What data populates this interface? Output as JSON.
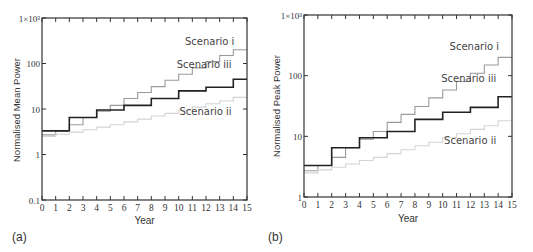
{
  "panels": [
    {
      "id": "a",
      "label": "(a)"
    },
    {
      "id": "b",
      "label": "(b)"
    }
  ],
  "chart_data": [
    {
      "type": "line",
      "step": true,
      "panel": "(a)",
      "title": "",
      "xlabel": "Year",
      "ylabel": "Normalised Mean Power",
      "yscale": "log",
      "xlim": [
        0,
        15
      ],
      "ylim": [
        0.1,
        1000
      ],
      "x_ticks": [
        0,
        1,
        2,
        3,
        4,
        5,
        6,
        7,
        8,
        9,
        10,
        11,
        12,
        13,
        14,
        15
      ],
      "y_ticks": [
        {
          "value": 0.1,
          "label": "0.1"
        },
        {
          "value": 1,
          "label": "1"
        },
        {
          "value": 10,
          "label": "10"
        },
        {
          "value": 100,
          "label": "100"
        },
        {
          "value": 1000,
          "label": "1×10³"
        }
      ],
      "grid": false,
      "x": [
        0,
        1,
        2,
        3,
        4,
        5,
        6,
        7,
        8,
        9,
        10,
        11,
        12,
        13,
        14,
        15
      ],
      "series": [
        {
          "name": "Scenario i",
          "color": "#9a9a9a",
          "width": 1.1,
          "values": [
            2.7,
            3.3,
            4.5,
            6.5,
            9,
            12,
            17,
            23,
            31,
            43,
            58,
            80,
            110,
            150,
            200,
            200
          ]
        },
        {
          "name": "Scenario iii",
          "color": "#222222",
          "width": 1.6,
          "values": [
            3.3,
            3.3,
            6.5,
            6.5,
            9.5,
            9.5,
            12,
            12,
            17,
            17,
            25,
            25,
            30,
            30,
            45,
            45
          ]
        },
        {
          "name": "Scenario ii",
          "color": "#d4d4d4",
          "width": 1.1,
          "values": [
            2.5,
            2.8,
            3.1,
            3.5,
            4,
            4.5,
            5.2,
            6,
            7,
            8,
            9.5,
            11,
            13,
            15,
            18,
            18
          ]
        }
      ],
      "annotations": [
        {
          "text": "Scenario i",
          "x": 13.2,
          "y": 260
        },
        {
          "text": "Scenario iii",
          "x": 13.0,
          "y": 80
        },
        {
          "text": "Scenario ii",
          "x": 13.0,
          "y": 7.5
        }
      ]
    },
    {
      "type": "line",
      "step": true,
      "panel": "(b)",
      "title": "",
      "xlabel": "Year",
      "ylabel": "Normalised Peak Power",
      "yscale": "log",
      "xlim": [
        0,
        15
      ],
      "ylim": [
        1,
        1000
      ],
      "x_ticks": [
        0,
        1,
        2,
        3,
        4,
        5,
        6,
        7,
        8,
        9,
        10,
        11,
        12,
        13,
        14,
        15
      ],
      "y_ticks": [
        {
          "value": 1,
          "label": "1"
        },
        {
          "value": 10,
          "label": "10"
        },
        {
          "value": 100,
          "label": "100"
        },
        {
          "value": 1000,
          "label": "1×10³"
        }
      ],
      "grid": false,
      "x": [
        0,
        1,
        2,
        3,
        4,
        5,
        6,
        7,
        8,
        9,
        10,
        11,
        12,
        13,
        14,
        15
      ],
      "series": [
        {
          "name": "Scenario i",
          "color": "#9a9a9a",
          "width": 1.1,
          "values": [
            2.7,
            3.3,
            4.5,
            6.5,
            9,
            12,
            17,
            23,
            31,
            43,
            58,
            80,
            110,
            150,
            200,
            200
          ]
        },
        {
          "name": "Scenario iii",
          "color": "#222222",
          "width": 1.6,
          "values": [
            3.3,
            3.3,
            6.5,
            6.5,
            9.5,
            9.5,
            12,
            12,
            19,
            19,
            25,
            25,
            30,
            30,
            45,
            45
          ]
        },
        {
          "name": "Scenario ii",
          "color": "#d4d4d4",
          "width": 1.1,
          "values": [
            2.5,
            2.8,
            3.1,
            3.5,
            4,
            4.5,
            5.2,
            6,
            7,
            8,
            9.5,
            11,
            13,
            15,
            18,
            18
          ]
        }
      ],
      "annotations": [
        {
          "text": "Scenario i",
          "x": 13.2,
          "y": 260
        },
        {
          "text": "Scenario iii",
          "x": 13.0,
          "y": 80
        },
        {
          "text": "Scenario ii",
          "x": 13.0,
          "y": 7.5
        }
      ]
    }
  ]
}
